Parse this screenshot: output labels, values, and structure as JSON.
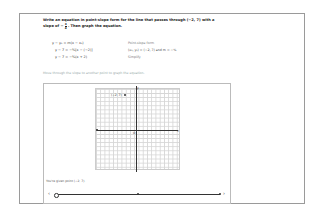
{
  "problem": {
    "prompt_part1": "Write an equation in point-slope form for the line that passes through (−2, 7) with a",
    "prompt_part2_prefix": "slope of −",
    "slope_num": "3",
    "slope_den": "4",
    "prompt_part2_suffix": ". Then graph the equation."
  },
  "steps": [
    {
      "equation": "y − y₁ = m(x − x₁)",
      "note": "Point-slope form"
    },
    {
      "equation": "y − 7 = −¾[x − (−2)]",
      "note": "(x₁, y₁) = (−2, 7) and m = −¾"
    },
    {
      "equation": "y − 7 = −¾(x + 2)",
      "note": "Simplify"
    }
  ],
  "hint": "Move through the slope to another point to graph the equation.",
  "graph": {
    "point_label": "(−2, 7)",
    "y_axis_label": "y",
    "x_axis_label": "x",
    "origin_label": "O"
  },
  "controls": {
    "given_text": "You're given point (−2, 7).",
    "prev_arrow": "‹",
    "next_arrow": "›"
  }
}
